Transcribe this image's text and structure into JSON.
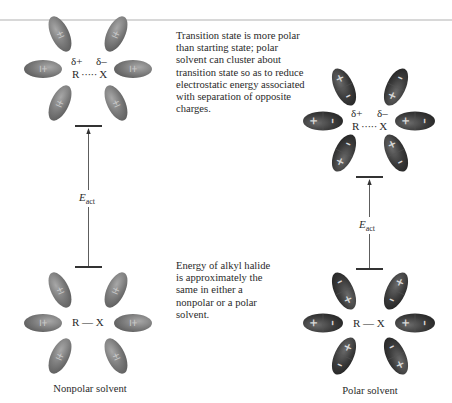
{
  "figure": {
    "left_panel": {
      "caption": "Nonpolar solvent",
      "transition_state": {
        "delta_plus": "δ+",
        "delta_minus": "δ–",
        "molecule": "R ····· X"
      },
      "ground_state": {
        "molecule": "R — X"
      },
      "solvent_label": "±",
      "energy_label": "E",
      "energy_subscript": "act"
    },
    "right_panel": {
      "caption": "Polar solvent",
      "transition_state": {
        "delta_plus": "δ+",
        "delta_minus": "δ–",
        "molecule": "R ····· X"
      },
      "ground_state": {
        "molecule": "R — X"
      },
      "energy_label": "E",
      "energy_subscript": "act"
    },
    "notes": {
      "transition_state_note": "Transition state is more polar than starting state; polar solvent can cluster about transition state so as to reduce electrostatic energy associated with separation of opposite charges.",
      "ground_state_note": "Energy of alkyl halide is approximately the same in either a nonpolar or a polar solvent."
    },
    "colors": {
      "nonpolar_solvent": "#7a7a7a",
      "polar_solvent": "#3a3a3a",
      "line": "#333333",
      "divider": "#d8d8d8"
    }
  }
}
